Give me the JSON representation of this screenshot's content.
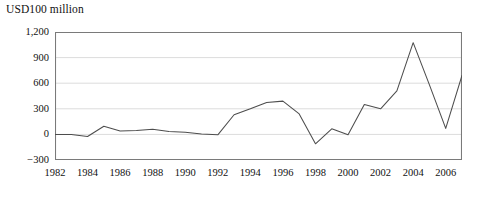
{
  "chart_data": {
    "type": "line",
    "title": "USD100 million",
    "xlabel": "",
    "ylabel": "",
    "ylim": [
      -300,
      1200
    ],
    "xlim": [
      1982,
      2007
    ],
    "yticks": [
      1200,
      900,
      600,
      300,
      0,
      -300
    ],
    "ytick_labels": [
      "1,200",
      "900",
      "600",
      "300",
      "0",
      "−300"
    ],
    "xticks": [
      1982,
      1983,
      1984,
      1985,
      1986,
      1987,
      1988,
      1989,
      1990,
      1991,
      1992,
      1993,
      1994,
      1995,
      1996,
      1997,
      1998,
      1999,
      2000,
      2001,
      2002,
      2003,
      2004,
      2005,
      2006,
      2007
    ],
    "xtick_labels": [
      "1982",
      "",
      "1984",
      "",
      "1986",
      "",
      "1988",
      "",
      "1990",
      "",
      "1992",
      "",
      "1994",
      "",
      "1996",
      "",
      "1998",
      "",
      "2000",
      "",
      "2002",
      "",
      "2004",
      "",
      "2006",
      ""
    ],
    "grid": "horizontal",
    "legend": "none",
    "line_color": "#4d4d4d",
    "axis_color": "#7a7a7a",
    "grid_color": "#dcdcdc",
    "x": [
      1982,
      1983,
      1984,
      1985,
      1986,
      1987,
      1988,
      1989,
      1990,
      1991,
      1992,
      1993,
      1994,
      1995,
      1996,
      1997,
      1998,
      1999,
      2000,
      2001,
      2002,
      2003,
      2004,
      2005,
      2006,
      2007
    ],
    "values": [
      0,
      0,
      -25,
      95,
      40,
      45,
      60,
      35,
      25,
      5,
      -5,
      230,
      300,
      375,
      390,
      240,
      -110,
      65,
      -5,
      350,
      300,
      510,
      1075,
      580,
      70,
      690
    ],
    "series": [
      {
        "name": "USD100 million",
        "values": [
          0,
          0,
          -25,
          95,
          40,
          45,
          60,
          35,
          25,
          5,
          -5,
          230,
          300,
          375,
          390,
          240,
          -110,
          65,
          -5,
          350,
          300,
          510,
          1075,
          580,
          70,
          690
        ]
      }
    ]
  }
}
